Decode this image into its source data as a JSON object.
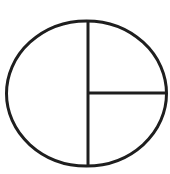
{
  "diagram": {
    "description": "Ellipse divided by a vertical diameter; the right half split by a horizontal radius into two quarters",
    "shape": "ellipse",
    "stroke_color": "#1e1e1e",
    "fill_color": "#ffffff",
    "stroke_width": 3,
    "ellipse": {
      "cx": 86.5,
      "cy": 93.5,
      "rx": 80,
      "ry": 72.5
    },
    "vertical_line": {
      "x1": 88,
      "y1": 21,
      "x2": 88,
      "y2": 166
    },
    "horizontal_line": {
      "x1": 88,
      "y1": 93,
      "x2": 166.5,
      "y2": 93
    },
    "regions": [
      {
        "name": "left-half",
        "fraction": "1/2"
      },
      {
        "name": "upper-right-quarter",
        "fraction": "1/4"
      },
      {
        "name": "lower-right-quarter",
        "fraction": "1/4"
      }
    ]
  }
}
